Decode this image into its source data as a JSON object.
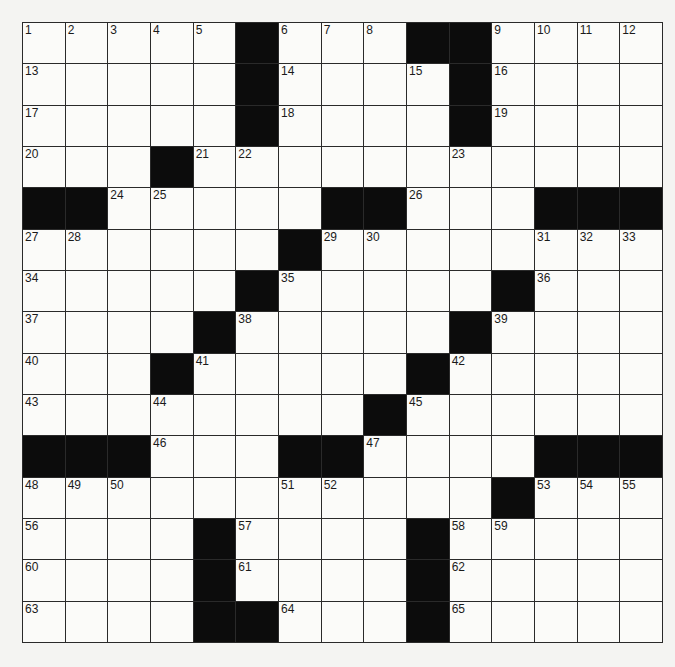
{
  "puzzle": {
    "rows": 15,
    "cols": 15,
    "colors": {
      "black_cell": "#0c0c0c",
      "white_cell": "#fbfbf9",
      "grid_line": "#2a2a2a",
      "background": "#f4f4f2"
    },
    "grid": [
      ".....#...##....",
      ".....#....#....",
      ".....#....#....",
      "...#...........",
      "##.....##...###",
      "......#........",
      ".....#.....#...",
      "....#.....#....",
      "...#.....#.....",
      "........#......",
      "###...##....###",
      "...........#...",
      "....#....#.....",
      "....#....#.....",
      "....##...#....."
    ],
    "numbers": [
      {
        "r": 0,
        "c": 0,
        "n": "1"
      },
      {
        "r": 0,
        "c": 1,
        "n": "2"
      },
      {
        "r": 0,
        "c": 2,
        "n": "3"
      },
      {
        "r": 0,
        "c": 3,
        "n": "4"
      },
      {
        "r": 0,
        "c": 4,
        "n": "5"
      },
      {
        "r": 0,
        "c": 6,
        "n": "6"
      },
      {
        "r": 0,
        "c": 7,
        "n": "7"
      },
      {
        "r": 0,
        "c": 8,
        "n": "8"
      },
      {
        "r": 0,
        "c": 11,
        "n": "9"
      },
      {
        "r": 0,
        "c": 12,
        "n": "10"
      },
      {
        "r": 0,
        "c": 13,
        "n": "11"
      },
      {
        "r": 0,
        "c": 14,
        "n": "12"
      },
      {
        "r": 1,
        "c": 0,
        "n": "13"
      },
      {
        "r": 1,
        "c": 6,
        "n": "14"
      },
      {
        "r": 1,
        "c": 9,
        "n": "15"
      },
      {
        "r": 1,
        "c": 11,
        "n": "16"
      },
      {
        "r": 2,
        "c": 0,
        "n": "17"
      },
      {
        "r": 2,
        "c": 6,
        "n": "18"
      },
      {
        "r": 2,
        "c": 11,
        "n": "19"
      },
      {
        "r": 3,
        "c": 0,
        "n": "20"
      },
      {
        "r": 3,
        "c": 4,
        "n": "21"
      },
      {
        "r": 3,
        "c": 5,
        "n": "22"
      },
      {
        "r": 3,
        "c": 10,
        "n": "23"
      },
      {
        "r": 4,
        "c": 2,
        "n": "24"
      },
      {
        "r": 4,
        "c": 3,
        "n": "25"
      },
      {
        "r": 4,
        "c": 9,
        "n": "26"
      },
      {
        "r": 5,
        "c": 0,
        "n": "27"
      },
      {
        "r": 5,
        "c": 1,
        "n": "28"
      },
      {
        "r": 5,
        "c": 7,
        "n": "29"
      },
      {
        "r": 5,
        "c": 8,
        "n": "30"
      },
      {
        "r": 5,
        "c": 12,
        "n": "31"
      },
      {
        "r": 5,
        "c": 13,
        "n": "32"
      },
      {
        "r": 5,
        "c": 14,
        "n": "33"
      },
      {
        "r": 6,
        "c": 0,
        "n": "34"
      },
      {
        "r": 6,
        "c": 6,
        "n": "35"
      },
      {
        "r": 6,
        "c": 12,
        "n": "36"
      },
      {
        "r": 7,
        "c": 0,
        "n": "37"
      },
      {
        "r": 7,
        "c": 5,
        "n": "38"
      },
      {
        "r": 7,
        "c": 11,
        "n": "39"
      },
      {
        "r": 8,
        "c": 0,
        "n": "40"
      },
      {
        "r": 8,
        "c": 4,
        "n": "41"
      },
      {
        "r": 8,
        "c": 10,
        "n": "42"
      },
      {
        "r": 9,
        "c": 0,
        "n": "43"
      },
      {
        "r": 9,
        "c": 3,
        "n": "44"
      },
      {
        "r": 9,
        "c": 9,
        "n": "45"
      },
      {
        "r": 10,
        "c": 3,
        "n": "46"
      },
      {
        "r": 10,
        "c": 8,
        "n": "47"
      },
      {
        "r": 11,
        "c": 0,
        "n": "48"
      },
      {
        "r": 11,
        "c": 1,
        "n": "49"
      },
      {
        "r": 11,
        "c": 2,
        "n": "50"
      },
      {
        "r": 11,
        "c": 6,
        "n": "51"
      },
      {
        "r": 11,
        "c": 7,
        "n": "52"
      },
      {
        "r": 11,
        "c": 12,
        "n": "53"
      },
      {
        "r": 11,
        "c": 13,
        "n": "54"
      },
      {
        "r": 11,
        "c": 14,
        "n": "55"
      },
      {
        "r": 12,
        "c": 0,
        "n": "56"
      },
      {
        "r": 12,
        "c": 5,
        "n": "57"
      },
      {
        "r": 12,
        "c": 10,
        "n": "58"
      },
      {
        "r": 12,
        "c": 11,
        "n": "59"
      },
      {
        "r": 13,
        "c": 0,
        "n": "60"
      },
      {
        "r": 13,
        "c": 5,
        "n": "61"
      },
      {
        "r": 13,
        "c": 10,
        "n": "62"
      },
      {
        "r": 14,
        "c": 0,
        "n": "63"
      },
      {
        "r": 14,
        "c": 6,
        "n": "64"
      },
      {
        "r": 14,
        "c": 10,
        "n": "65"
      }
    ]
  }
}
